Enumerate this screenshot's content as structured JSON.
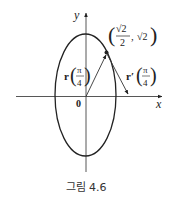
{
  "figure": {
    "caption": "그림 4.6",
    "axes": {
      "x_label": "x",
      "y_label": "y",
      "origin_label": "0"
    },
    "curve": {
      "type": "ellipse",
      "description": "r(t) = cos t i + 2 sin t j"
    },
    "point": {
      "label_x_num": "√2",
      "label_x_den": "2",
      "label_sep": ",",
      "label_y": "√2",
      "label_open": "(",
      "label_close": ")"
    },
    "position_vector": {
      "name": "r",
      "arg_num": "π",
      "arg_den": "4"
    },
    "tangent_vector": {
      "name": "r′",
      "arg_num": "π",
      "arg_den": "4"
    },
    "colors": {
      "stroke": "#222222",
      "background": "#ffffff"
    }
  }
}
